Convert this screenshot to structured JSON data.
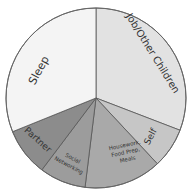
{
  "chart_data": {
    "type": "pie",
    "title": "",
    "start_angle_deg": 0,
    "direction": "clockwise",
    "center": [
      96,
      98
    ],
    "radius": 90,
    "slices": [
      {
        "label": "Job/Other Children",
        "percent": 30.8,
        "start": 0,
        "end": 111,
        "color": "#e2e2e2"
      },
      {
        "label": "Self",
        "percent": 7.2,
        "start": 111,
        "end": 137,
        "color": "#c6c6c6"
      },
      {
        "label": "Housework, Food Prep, Meals",
        "percent": 13.9,
        "start": 137,
        "end": 187,
        "color": "#a9a9a9"
      },
      {
        "label": "Social Networking",
        "percent": 8.3,
        "start": 187,
        "end": 217,
        "color": "#9c9c9c"
      },
      {
        "label": "Partner",
        "percent": 8.6,
        "start": 217,
        "end": 248,
        "color": "#8c8c8c"
      },
      {
        "label": "Sleep",
        "percent": 31.1,
        "start": 248,
        "end": 360,
        "color": "#f4f4f4"
      }
    ],
    "legend": "none (labels drawn inside slices)",
    "grid": false
  },
  "labels": {
    "job": "Job/Other Children",
    "self": "Self",
    "housework_1": "Housework,",
    "housework_2": "Food Prep,",
    "housework_3": "Meals",
    "social_1": "Social",
    "social_2": "Networking",
    "partner": "Partner",
    "sleep": "Sleep"
  }
}
